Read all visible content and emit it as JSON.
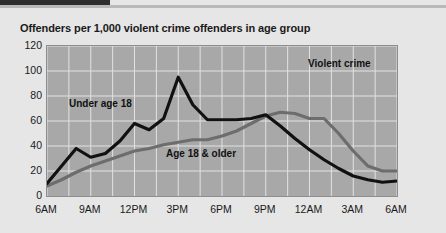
{
  "header": {
    "accent_color": "#2e2e2e",
    "rule_color": "#b9b9b9"
  },
  "chart_data": {
    "type": "line",
    "title": "Offenders per 1,000 violent crime offenders in age group",
    "xlabel": "",
    "ylabel": "",
    "ylim": [
      0,
      120
    ],
    "yticks": [
      0,
      20,
      40,
      60,
      80,
      100,
      120
    ],
    "xticks": [
      "6AM",
      "9AM",
      "12PM",
      "3PM",
      "6PM",
      "9PM",
      "12AM",
      "3AM",
      "6AM"
    ],
    "grid": true,
    "legend_position": "inline-annotations",
    "annotations": [
      {
        "text": "Violent crime",
        "x": "9PM",
        "y": 108
      }
    ],
    "plot_bg": "#a8a8a8",
    "grid_color": "#e2e2e2",
    "x": [
      "6AM",
      "7AM",
      "8AM",
      "9AM",
      "10AM",
      "11AM",
      "12PM",
      "1PM",
      "2PM",
      "3PM",
      "4PM",
      "5PM",
      "6PM",
      "7PM",
      "8PM",
      "9PM",
      "10PM",
      "11PM",
      "12AM",
      "1AM",
      "2AM",
      "3AM",
      "4AM",
      "5AM",
      "6AM"
    ],
    "series": [
      {
        "name": "Under age 18",
        "color": "#111111",
        "width": 3.2,
        "values": [
          10,
          24,
          38,
          31,
          34,
          44,
          58,
          53,
          62,
          95,
          73,
          61,
          61,
          61,
          62,
          65,
          56,
          46,
          37,
          29,
          22,
          16,
          13,
          11,
          12
        ]
      },
      {
        "name": "Age 18 & older",
        "color": "#6d6d6d",
        "width": 3.2,
        "values": [
          8,
          13,
          19,
          24,
          28,
          32,
          36,
          38,
          41,
          43,
          45,
          45,
          48,
          52,
          58,
          64,
          67,
          66,
          62,
          62,
          50,
          36,
          24,
          20,
          20
        ]
      }
    ]
  }
}
